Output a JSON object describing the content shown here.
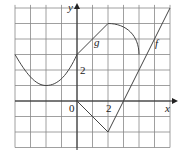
{
  "chart_data": {
    "type": "line",
    "title": "",
    "xlabel": "x",
    "ylabel": "y",
    "xlim": [
      -4,
      6
    ],
    "ylim": [
      -3,
      6
    ],
    "grid": true,
    "tick_labels": {
      "origin": "0",
      "x": "2",
      "y": "2"
    },
    "series": [
      {
        "name": "g",
        "description": "smooth curve from (-4,3) down to min (-2,1), up to (0,3), straight to (2,5), arc down to (4,3)",
        "points": [
          [
            -4,
            3
          ],
          [
            -3,
            1.6
          ],
          [
            -2,
            1
          ],
          [
            -1,
            1.6
          ],
          [
            0,
            3
          ],
          [
            1,
            4
          ],
          [
            2,
            5
          ],
          [
            3,
            4.6
          ],
          [
            4,
            3
          ]
        ]
      },
      {
        "name": "f",
        "description": "piecewise linear",
        "points": [
          [
            0,
            0
          ],
          [
            2,
            -2
          ],
          [
            3,
            0
          ],
          [
            4,
            2
          ],
          [
            5,
            4
          ],
          [
            6,
            6
          ]
        ]
      }
    ]
  },
  "labels": {
    "x_axis": "x",
    "y_axis": "y",
    "origin": "0",
    "x_tick": "2",
    "y_tick": "2",
    "g": "g",
    "f": "f"
  }
}
